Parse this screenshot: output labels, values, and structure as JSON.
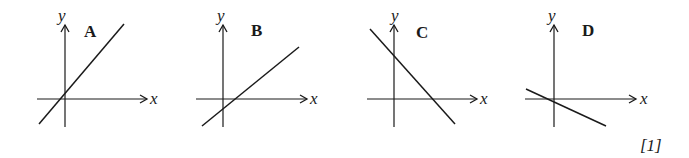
{
  "graphs": [
    {
      "label": "A",
      "x_axis": "x",
      "y_axis": "y",
      "slope": "positive",
      "y_intercept": "positive",
      "description": "steep positive gradient, positive y-intercept"
    },
    {
      "label": "B",
      "x_axis": "x",
      "y_axis": "y",
      "slope": "positive",
      "y_intercept": "negative",
      "description": "shallow positive gradient, negative y-intercept"
    },
    {
      "label": "C",
      "x_axis": "x",
      "y_axis": "y",
      "slope": "negative",
      "y_intercept": "positive",
      "description": "steep negative gradient, positive y-intercept"
    },
    {
      "label": "D",
      "x_axis": "x",
      "y_axis": "y",
      "slope": "negative",
      "y_intercept": "negative",
      "description": "shallow negative gradient, slightly negative y-intercept"
    }
  ],
  "marks": "[1]",
  "colors": {
    "ink": "#1a1a1a",
    "background": "#ffffff"
  }
}
